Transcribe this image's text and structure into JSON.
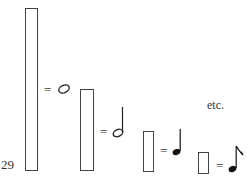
{
  "figure": {
    "number_label": "29",
    "trailing_text": "etc.",
    "rows": [
      {
        "bar": "tall-rectangle",
        "equals": "=",
        "note": "whole-note"
      },
      {
        "bar": "medium-rectangle",
        "equals": "=",
        "note": "half-note"
      },
      {
        "bar": "short-rectangle",
        "equals": "=",
        "note": "quarter-note"
      },
      {
        "bar": "shortest-rectangle",
        "equals": "=",
        "note": "eighth-note"
      }
    ]
  }
}
